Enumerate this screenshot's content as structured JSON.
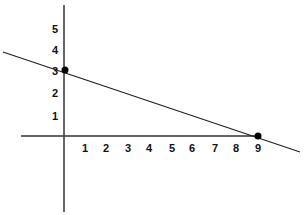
{
  "chart_data": {
    "type": "line",
    "title": "",
    "xlabel": "",
    "ylabel": "",
    "x_ticks": [
      "1",
      "2",
      "3",
      "4",
      "5",
      "6",
      "7",
      "8",
      "9"
    ],
    "y_ticks": [
      "1",
      "2",
      "3",
      "4",
      "5"
    ],
    "series": [
      {
        "name": "line",
        "x": [
          0,
          9
        ],
        "y": [
          3,
          0
        ]
      }
    ],
    "points": [
      {
        "x": 0,
        "y": 3,
        "label": "y-intercept"
      },
      {
        "x": 9,
        "y": 0,
        "label": "x-intercept"
      }
    ],
    "xlim": [
      -2,
      11
    ],
    "ylim": [
      -3.5,
      6
    ],
    "grid": false,
    "colors": {
      "axis": "#333333",
      "line": "#222222",
      "point": "#000000"
    }
  }
}
